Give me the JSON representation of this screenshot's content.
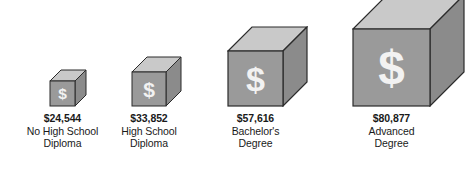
{
  "chart_data": {
    "type": "bar",
    "title": "",
    "subtitle": "",
    "xlabel": "",
    "ylabel": "",
    "categories": [
      "No High School Diploma",
      "High School Diploma",
      "Bachelor's Degree",
      "Advanced Degree"
    ],
    "values": [
      24544,
      33852,
      57616,
      80877
    ],
    "value_labels": [
      "$24,544",
      "$33,852",
      "$57,616",
      "$80,877"
    ],
    "value_prefix": "$",
    "grid": false,
    "legend": "none",
    "glyph": "$",
    "note": "3D cube pictograph; cube edge length scales with value"
  },
  "colors": {
    "background": "#ffffff",
    "cube_front": "#9a9a9a",
    "cube_top": "#c9c9c9",
    "cube_side": "#8b8b8b",
    "cube_outline": "#2b2b2b",
    "glyph": "#f2f2f2",
    "text": "#1a1a1a"
  },
  "bars": [
    {
      "id": "no-high-school-diploma",
      "value_label": "$24,544",
      "value": 24544,
      "category_line1": "No High School",
      "category_line2": "Diploma",
      "glyph": "$"
    },
    {
      "id": "high-school-diploma",
      "value_label": "$33,852",
      "value": 33852,
      "category_line1": "High School",
      "category_line2": "Diploma",
      "glyph": "$"
    },
    {
      "id": "bachelors-degree",
      "value_label": "$57,616",
      "value": 57616,
      "category_line1": "Bachelor's",
      "category_line2": "Degree",
      "glyph": "$"
    },
    {
      "id": "advanced-degree",
      "value_label": "$80,877",
      "value": 80877,
      "category_line1": "Advanced",
      "category_line2": "Degree",
      "glyph": "$"
    }
  ]
}
